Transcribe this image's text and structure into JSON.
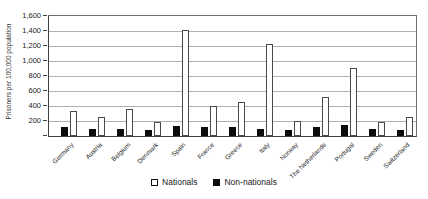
{
  "chart_data": {
    "type": "bar",
    "title": "",
    "xlabel": "",
    "ylabel": "Prisoners per 100,000 population",
    "ylim": [
      0,
      1600
    ],
    "ytick_step": 200,
    "ytick_labels": [
      "1,600",
      "1,400",
      "1,200",
      "1,000",
      "800",
      "600",
      "400",
      "200"
    ],
    "grid": "horizontal",
    "legend_position": "bottom",
    "categories": [
      "Germany",
      "Austria",
      "Belgium",
      "Denmark",
      "Spain",
      "France",
      "Greece",
      "Italy",
      "Norway",
      "The Netherlands",
      "Portugal",
      "Sweden",
      "Switzerland"
    ],
    "series": [
      {
        "name": "Nationals",
        "fill": "#ffffff",
        "values": [
          340,
          255,
          355,
          185,
          1410,
          400,
          450,
          1230,
          200,
          515,
          910,
          190,
          250
        ]
      },
      {
        "name": "Non-nationals",
        "fill": "#0d0d0d",
        "values": [
          120,
          100,
          95,
          75,
          130,
          125,
          115,
          100,
          80,
          115,
          150,
          100,
          80
        ]
      }
    ],
    "bar_order_left_to_right": [
      "Non-nationals",
      "Nationals"
    ]
  },
  "colors": {
    "background": "#ffffff",
    "gridline": "#b0b0b0",
    "axis": "#404040",
    "bar_outline": "#4a4a4a",
    "text": "#1a1a1a"
  }
}
